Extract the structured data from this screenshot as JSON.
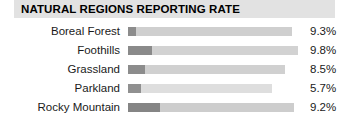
{
  "title": "NATURAL REGIONS REPORTING RATE",
  "chart_data": {
    "type": "bar",
    "title": "NATURAL REGIONS REPORTING RATE",
    "xlabel": "",
    "ylabel": "",
    "orientation": "horizontal",
    "grid": false,
    "legend": null,
    "categories": [
      "Boreal Forest",
      "Foothills",
      "Grassland",
      "Parkland",
      "Rocky Mountain"
    ],
    "values": [
      9.3,
      9.8,
      8.5,
      5.7,
      9.2
    ],
    "value_labels": [
      "9.3%",
      "9.8%",
      "8.5%",
      "5.7%",
      "9.2%"
    ],
    "bars": [
      {
        "category": "Boreal Forest",
        "value": 9.3,
        "value_label": "9.3%",
        "dark_segment_px": 8,
        "light_segment_px": 156,
        "total_px": 164,
        "dark_color": "#8c8c8c",
        "light_color": "#cfcfcf"
      },
      {
        "category": "Foothills",
        "value": 9.8,
        "value_label": "9.8%",
        "dark_segment_px": 24,
        "light_segment_px": 146,
        "total_px": 170,
        "dark_color": "#8a8a8a",
        "light_color": "#d2d2d2"
      },
      {
        "category": "Grassland",
        "value": 8.5,
        "value_label": "8.5%",
        "dark_segment_px": 17,
        "light_segment_px": 140,
        "total_px": 157,
        "dark_color": "#8c8c8c",
        "light_color": "#d0d0d0"
      },
      {
        "category": "Parkland",
        "value": 5.7,
        "value_label": "5.7%",
        "dark_segment_px": 13,
        "light_segment_px": 131,
        "total_px": 144,
        "dark_color": "#909090",
        "light_color": "#dedede"
      },
      {
        "category": "Rocky Mountain",
        "value": 9.2,
        "value_label": "9.2%",
        "dark_segment_px": 32,
        "light_segment_px": 134,
        "total_px": 166,
        "dark_color": "#858585",
        "light_color": "#cdcdcd"
      }
    ]
  },
  "colors": {
    "title_band": "#e2e2e2",
    "title_text": "#000000",
    "label_text": "#1a1a1a",
    "bar_dark": "#8c8c8c",
    "bar_light": "#cfcfcf",
    "background": "#ffffff"
  }
}
